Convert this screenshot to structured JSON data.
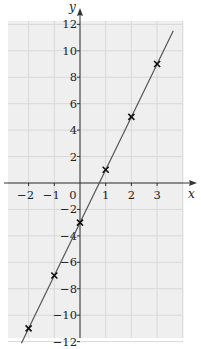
{
  "chart_data": {
    "type": "scatter",
    "title": "",
    "xlabel": "x",
    "ylabel": "y",
    "xlim": [
      -2.8,
      4.0
    ],
    "ylim": [
      -12,
      12
    ],
    "grid": true,
    "legend": null,
    "x_ticks": [
      -2,
      -1,
      0,
      1,
      2,
      3
    ],
    "x_tick_labels": [
      "−2",
      "−1",
      "0",
      "1",
      "2",
      "3"
    ],
    "y_ticks": [
      -12,
      -10,
      -8,
      -6,
      -4,
      -2,
      2,
      4,
      6,
      8,
      10,
      12
    ],
    "y_tick_labels": [
      "−12",
      "−10",
      "−8",
      "−6",
      "−4",
      "−2",
      "2",
      "4",
      "6",
      "8",
      "10",
      "12"
    ],
    "series": [
      {
        "name": "points",
        "marker": "x",
        "x": [
          -2,
          -1,
          0,
          1,
          2,
          3
        ],
        "y": [
          -11,
          -7,
          -3,
          1,
          5,
          9
        ]
      },
      {
        "name": "line of best fit",
        "type": "line",
        "equation": "y = 4x - 3",
        "slope": 4,
        "intercept": -3
      }
    ],
    "colors": {
      "grid_background": "#efefef",
      "grid_line": "#d8d8d8",
      "axis": "#333333",
      "line": "#555555",
      "marker": "#111111"
    }
  }
}
